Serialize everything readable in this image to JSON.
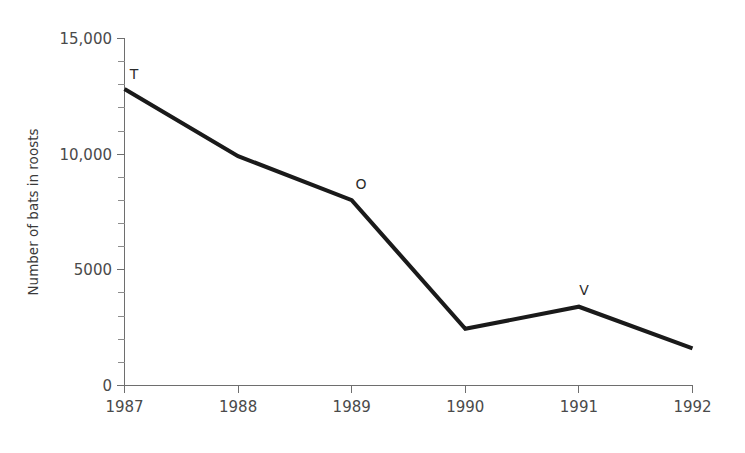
{
  "chart_data": {
    "type": "line",
    "title": "",
    "subtitle": "",
    "xlabel": "",
    "ylabel": "Number of bats in roosts",
    "x": [
      1987,
      1988,
      1989,
      1990,
      1991,
      1992
    ],
    "categories": [
      "1987",
      "1988",
      "1989",
      "1990",
      "1991",
      "1992"
    ],
    "values": [
      12800,
      9900,
      8000,
      2450,
      3400,
      1600
    ],
    "series": [
      {
        "name": "Number of bats in roosts",
        "values": [
          12800,
          9900,
          8000,
          2450,
          3400,
          1600
        ],
        "color": "#1a1a1a"
      }
    ],
    "xlim": [
      1987,
      1992
    ],
    "ylim": [
      0,
      15000
    ],
    "ytick_values": [
      0,
      5000,
      10000,
      15000
    ],
    "ytick_labels": [
      "0",
      "5000",
      "10,000",
      "15,000"
    ],
    "xtick_labels": [
      "1987",
      "1988",
      "1989",
      "1990",
      "1991",
      "1992"
    ],
    "y_minor_tick_step": 1000,
    "grid": false,
    "legend": false,
    "legend_position": "none",
    "annotations": [
      {
        "label": "T",
        "x": 1987,
        "y": 12800
      },
      {
        "label": "O",
        "x": 1989,
        "y": 8000
      },
      {
        "label": "V",
        "x": 1991,
        "y": 3400
      }
    ],
    "colors": {
      "background": "#ffffff",
      "line": "#1a1a1a",
      "axis": "#6e6e6e",
      "text": "#4a4a4a"
    }
  },
  "axes": {
    "y_title": "Number of bats in roosts",
    "y_labels": {
      "t15000": "15,000",
      "t10000": "10,000",
      "t5000": "5000",
      "t0": "0"
    },
    "x_labels": {
      "y1987": "1987",
      "y1988": "1988",
      "y1989": "1989",
      "y1990": "1990",
      "y1991": "1991",
      "y1992": "1992"
    }
  },
  "annotations": {
    "a1": "T",
    "a2": "O",
    "a3": "V"
  }
}
